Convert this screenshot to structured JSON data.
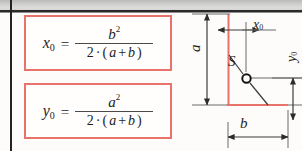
{
  "page": {
    "kind": "textbook-figure-fragment",
    "width": 302,
    "height": 151,
    "background_color": "#fdfcfa"
  },
  "colors": {
    "box_border": "#e8736b",
    "profile_outline": "#e8736b",
    "ink": "#1d1d1d",
    "dimension_line": "#3b3b3b",
    "scan_band": "#cfcfcd"
  },
  "formulas": [
    {
      "id": "x0",
      "lhs_symbol": "x",
      "lhs_subscript": "0",
      "equals": "=",
      "numerator_symbol": "b",
      "numerator_exponent": "2",
      "denominator": "2 · (a + b)",
      "denominator_parts": {
        "factor": "2",
        "dot": "·",
        "open": "(",
        "term1": "a",
        "plus": "+",
        "term2": "b",
        "close": ")"
      },
      "plain_text": "x0 = b^2 / (2 · (a + b))"
    },
    {
      "id": "y0",
      "lhs_symbol": "y",
      "lhs_subscript": "0",
      "equals": "=",
      "numerator_symbol": "a",
      "numerator_exponent": "2",
      "denominator": "2 · (a + b)",
      "denominator_parts": {
        "factor": "2",
        "dot": "·",
        "open": "(",
        "term1": "a",
        "plus": "+",
        "term2": "b",
        "close": ")"
      },
      "plain_text": "y0 = a^2 / (2 · (a + b))"
    }
  ],
  "diagram": {
    "labels": {
      "a": {
        "symbol": "a",
        "subscript": "",
        "orientation": "vertical"
      },
      "b": {
        "symbol": "b",
        "subscript": "",
        "orientation": "horizontal"
      },
      "x0": {
        "symbol": "x",
        "subscript": "0",
        "orientation": "horizontal"
      },
      "y0": {
        "symbol": "y",
        "subscript": "0",
        "orientation": "vertical"
      },
      "centroid": {
        "symbol": "S",
        "subscript": ""
      }
    }
  }
}
